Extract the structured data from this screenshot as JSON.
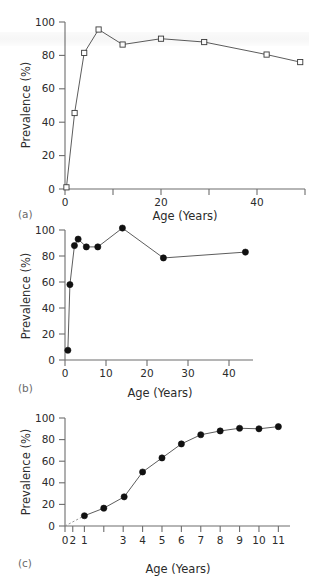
{
  "figure": {
    "panels": [
      {
        "id": "a",
        "label": "(a)",
        "chart_data": {
          "type": "line",
          "title": "",
          "xlabel": "Age (Years)",
          "ylabel": "Prevalence (%)",
          "xlim": [
            0,
            50
          ],
          "ylim": [
            0,
            100
          ],
          "xticks": [
            0,
            10,
            20,
            30,
            40,
            50
          ],
          "xticklabels": [
            "0",
            "",
            "20",
            "",
            "40",
            ""
          ],
          "yticks": [
            0,
            20,
            40,
            60,
            80,
            100
          ],
          "yticklabels": [
            "0",
            "20",
            "40",
            "60",
            "80",
            "100"
          ],
          "grid": false,
          "legend": "none",
          "marker": "open-square",
          "x": [
            0.3,
            2.0,
            4.0,
            7.0,
            12.0,
            20.0,
            29.0,
            42.0,
            49.0
          ],
          "y": [
            1,
            45.5,
            81.5,
            95.5,
            86.5,
            90.0,
            88.0,
            80.5,
            76.0
          ]
        }
      },
      {
        "id": "b",
        "label": "(b)",
        "chart_data": {
          "type": "line",
          "title": "",
          "xlabel": "Age (Years)",
          "ylabel": "Prevalence (%)",
          "xlim": [
            0,
            46
          ],
          "ylim": [
            0,
            100
          ],
          "xticks": [
            0,
            10,
            20,
            30,
            40
          ],
          "xticklabels": [
            "0",
            "10",
            "20",
            "30",
            "40"
          ],
          "yticks": [
            0,
            20,
            40,
            60,
            80,
            100
          ],
          "yticklabels": [
            "0",
            "20",
            "40",
            "60",
            "80",
            "100"
          ],
          "grid": false,
          "legend": "none",
          "marker": "filled-circle",
          "x": [
            0.7,
            1.2,
            2.3,
            3.2,
            5.2,
            8.0,
            14.0,
            24.0,
            44.0
          ],
          "y": [
            7.5,
            58.0,
            88.0,
            93.0,
            87.0,
            87.0,
            101.5,
            78.5,
            83.0
          ]
        }
      },
      {
        "id": "c",
        "label": "(c)",
        "chart_data": {
          "type": "line",
          "title": "",
          "xlabel": "Age (Years)",
          "ylabel": "Prevalence (%)",
          "xlim": [
            0,
            11.6
          ],
          "ylim": [
            0,
            100
          ],
          "xticks": [
            0,
            0.4,
            1,
            2,
            3,
            4,
            5,
            6,
            7,
            8,
            9,
            10,
            11
          ],
          "xticklabels": [
            "0",
            "2",
            "1",
            "",
            "3",
            "4",
            "5",
            "6",
            "7",
            "8",
            "9",
            "10",
            "11"
          ],
          "yticks": [
            0,
            20,
            40,
            60,
            80,
            100
          ],
          "yticklabels": [
            "0",
            "20",
            "40",
            "60",
            "80",
            "100"
          ],
          "grid": false,
          "legend": "none",
          "marker": "filled-circle",
          "dashed_segment": "0 to first point",
          "x": [
            1.0,
            2.0,
            3.05,
            4.0,
            5.0,
            6.0,
            7.0,
            8.0,
            9.0,
            10.0,
            11.0
          ],
          "y": [
            9.5,
            16.5,
            27.0,
            50.0,
            63.0,
            76.0,
            84.5,
            88.0,
            90.5,
            90.0,
            92.0
          ]
        }
      }
    ]
  }
}
